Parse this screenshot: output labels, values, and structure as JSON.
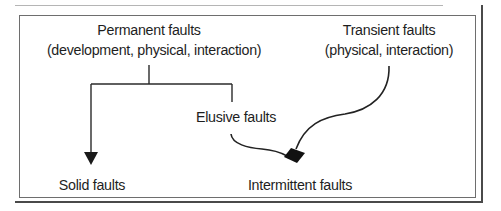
{
  "diagram": {
    "nodes": {
      "permanent": {
        "line1": "Permanent faults",
        "line2": "(development, physical, interaction)"
      },
      "transient": {
        "line1": "Transient faults",
        "line2": "(physical, interaction)"
      },
      "elusive": {
        "line1": "Elusive faults"
      },
      "solid": {
        "line1": "Solid faults"
      },
      "intermittent": {
        "line1": "Intermittent faults"
      }
    },
    "edges": [
      {
        "from": "Permanent faults",
        "to": "Solid faults",
        "style": "orthogonal-arrow"
      },
      {
        "from": "Permanent faults",
        "to": "Elusive faults",
        "style": "orthogonal-line"
      },
      {
        "from": "Elusive faults",
        "to": "Intermittent faults",
        "style": "curve"
      },
      {
        "from": "Transient faults",
        "to": "Intermittent faults",
        "style": "curve"
      }
    ],
    "colors": {
      "stroke": "#222222",
      "text": "#1e1e1e",
      "frame": "#6e6e6e"
    }
  }
}
